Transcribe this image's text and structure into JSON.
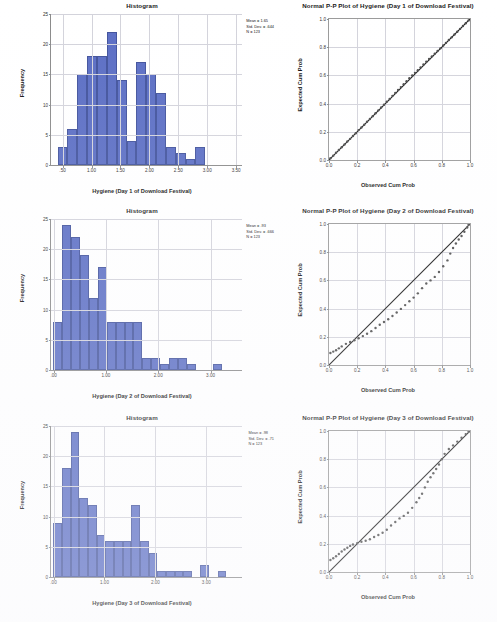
{
  "document": {
    "kind": "spss-output-figure-sheet",
    "background_color": "#ffffff",
    "bar_color": "#5b6ec4",
    "bar_edge_color": "#41529c",
    "grid_color": "#d3d3db",
    "point_color": "#4a4a4a",
    "reference_line_color": "#111111"
  },
  "chart_data": [
    {
      "type": "bar",
      "id": "histogram-day1",
      "title": "Histogram",
      "xlabel": "Hygiene (Day 1 of Download Festival)",
      "ylabel": "Frequency",
      "ylim": [
        0,
        25
      ],
      "yticks": [
        0,
        5,
        10,
        15,
        20,
        25
      ],
      "xlim": [
        0.3,
        3.6
      ],
      "xticks": [
        0.5,
        1.0,
        1.5,
        2.0,
        2.5,
        3.0,
        3.5
      ],
      "xticklabels": [
        ".50",
        "1.00",
        "1.50",
        "2.00",
        "2.50",
        "3.00",
        "3.50"
      ],
      "grid": true,
      "bin_width": 0.17,
      "categories": [
        "0.50",
        "0.67",
        "0.84",
        "1.01",
        "1.18",
        "1.35",
        "1.52",
        "1.69",
        "1.86",
        "2.03",
        "2.20",
        "2.37",
        "2.54",
        "2.71",
        "2.88",
        "3.05",
        "3.22"
      ],
      "values": [
        3,
        6,
        15,
        18,
        18,
        22,
        14,
        4,
        17,
        15,
        12,
        3,
        2,
        1,
        3
      ],
      "annotation": {
        "mean_label": "Mean = 1.65",
        "std_label": "Std. Dev. = .644",
        "n_label": "N = 123",
        "mean": 1.65,
        "std_dev": 0.644,
        "n": 123
      }
    },
    {
      "type": "scatter",
      "id": "pp-plot-day1",
      "title": "Normal P-P Plot of Hygiene (Day 1 of Download Festival)",
      "xlabel": "Observed Cum Prob",
      "ylabel": "Expected Cum Prob",
      "xlim": [
        0,
        1
      ],
      "ylim": [
        0,
        1
      ],
      "xticks": [
        0.0,
        0.2,
        0.4,
        0.6,
        0.8,
        1.0
      ],
      "yticks": [
        0.0,
        0.2,
        0.4,
        0.6,
        0.8,
        1.0
      ],
      "xticklabels": [
        "0.0",
        "0.2",
        "0.4",
        "0.6",
        "0.8",
        "1.0"
      ],
      "yticklabels": [
        "0.0",
        "0.2",
        "0.4",
        "0.6",
        "0.8",
        "1.0"
      ],
      "grid": true,
      "reference_line": [
        [
          0,
          0
        ],
        [
          1,
          1
        ]
      ],
      "points_x": [
        0.01,
        0.03,
        0.05,
        0.07,
        0.09,
        0.11,
        0.13,
        0.15,
        0.17,
        0.19,
        0.21,
        0.23,
        0.25,
        0.27,
        0.29,
        0.31,
        0.33,
        0.35,
        0.37,
        0.39,
        0.41,
        0.43,
        0.45,
        0.47,
        0.49,
        0.51,
        0.53,
        0.55,
        0.57,
        0.59,
        0.61,
        0.63,
        0.65,
        0.67,
        0.69,
        0.71,
        0.73,
        0.75,
        0.77,
        0.79,
        0.81,
        0.83,
        0.85,
        0.87,
        0.89,
        0.91,
        0.93,
        0.95,
        0.97,
        0.99
      ],
      "points_y": [
        0.012,
        0.031,
        0.052,
        0.071,
        0.09,
        0.11,
        0.131,
        0.15,
        0.17,
        0.19,
        0.212,
        0.231,
        0.25,
        0.271,
        0.291,
        0.311,
        0.332,
        0.352,
        0.372,
        0.392,
        0.414,
        0.433,
        0.455,
        0.476,
        0.497,
        0.517,
        0.538,
        0.559,
        0.58,
        0.599,
        0.618,
        0.637,
        0.657,
        0.677,
        0.697,
        0.716,
        0.735,
        0.754,
        0.773,
        0.792,
        0.812,
        0.831,
        0.851,
        0.87,
        0.89,
        0.91,
        0.93,
        0.95,
        0.97,
        0.99
      ]
    },
    {
      "type": "bar",
      "id": "histogram-day2",
      "title": "Histogram",
      "xlabel": "Hygiene (Day 2 of Download Festival)",
      "ylabel": "Frequency",
      "ylim": [
        0,
        25
      ],
      "yticks": [
        0,
        5,
        10,
        15,
        20,
        25
      ],
      "xlim": [
        -0.05,
        3.6
      ],
      "xticks": [
        0.0,
        1.0,
        2.0,
        3.0
      ],
      "xticklabels": [
        ".00",
        "1.00",
        "2.00",
        "3.00"
      ],
      "grid": true,
      "bin_width": 0.17,
      "categories": [
        "0.08",
        "0.25",
        "0.42",
        "0.59",
        "0.76",
        "0.93",
        "1.10",
        "1.27",
        "1.44",
        "1.61",
        "1.78",
        "1.95",
        "2.12",
        "2.29",
        "2.46",
        "2.63",
        "2.80",
        "2.97",
        "3.14",
        "3.31",
        "3.48"
      ],
      "values": [
        8,
        24,
        22,
        19,
        12,
        17,
        8,
        8,
        8,
        8,
        2,
        2,
        1,
        2,
        2,
        1,
        0,
        0,
        1
      ],
      "annotation": {
        "mean_label": "Mean = .93",
        "std_label": "Std. Dev. = .666",
        "n_label": "N = 123",
        "mean": 0.93,
        "std_dev": 0.666,
        "n": 123
      }
    },
    {
      "type": "scatter",
      "id": "pp-plot-day2",
      "title": "Normal P-P Plot of Hygiene (Day 2 of Download Festival)",
      "xlabel": "Observed Cum Prob",
      "ylabel": "Expected Cum Prob",
      "xlim": [
        0,
        1
      ],
      "ylim": [
        0,
        1
      ],
      "xticks": [
        0.0,
        0.2,
        0.4,
        0.6,
        0.8,
        1.0
      ],
      "yticks": [
        0.0,
        0.2,
        0.4,
        0.6,
        0.8,
        1.0
      ],
      "xticklabels": [
        "0.0",
        "0.2",
        "0.4",
        "0.6",
        "0.8",
        "1.0"
      ],
      "yticklabels": [
        "0.0",
        "0.2",
        "0.4",
        "0.6",
        "0.8",
        "1.0"
      ],
      "grid": true,
      "reference_line": [
        [
          0,
          0
        ],
        [
          1,
          1
        ]
      ],
      "points_x": [
        0.01,
        0.03,
        0.05,
        0.07,
        0.09,
        0.12,
        0.15,
        0.18,
        0.21,
        0.24,
        0.27,
        0.3,
        0.33,
        0.36,
        0.39,
        0.42,
        0.45,
        0.48,
        0.51,
        0.54,
        0.57,
        0.6,
        0.63,
        0.66,
        0.69,
        0.72,
        0.75,
        0.78,
        0.81,
        0.84,
        0.86,
        0.88,
        0.9,
        0.92,
        0.94,
        0.96,
        0.98,
        0.99
      ],
      "points_y": [
        0.085,
        0.095,
        0.105,
        0.118,
        0.132,
        0.15,
        0.163,
        0.175,
        0.19,
        0.205,
        0.222,
        0.24,
        0.262,
        0.285,
        0.305,
        0.325,
        0.348,
        0.372,
        0.398,
        0.425,
        0.452,
        0.478,
        0.508,
        0.545,
        0.578,
        0.6,
        0.625,
        0.66,
        0.7,
        0.742,
        0.79,
        0.83,
        0.862,
        0.89,
        0.915,
        0.945,
        0.975,
        0.995
      ]
    },
    {
      "type": "bar",
      "id": "histogram-day3",
      "title": "Histogram",
      "xlabel": "Hygiene (Day 3 of Download Festival)",
      "ylabel": "Frequency",
      "ylim": [
        0,
        25
      ],
      "yticks": [
        0,
        5,
        10,
        15,
        20,
        25
      ],
      "xlim": [
        -0.05,
        3.7
      ],
      "xticks": [
        0.0,
        1.0,
        2.0,
        3.0
      ],
      "xticklabels": [
        ".00",
        "1.00",
        "2.00",
        "3.00"
      ],
      "grid": true,
      "bin_width": 0.17,
      "categories": [
        "0.08",
        "0.25",
        "0.42",
        "0.59",
        "0.76",
        "0.93",
        "1.10",
        "1.27",
        "1.44",
        "1.61",
        "1.78",
        "1.95",
        "2.12",
        "2.29",
        "2.46",
        "2.63",
        "2.80",
        "2.97",
        "3.14",
        "3.31",
        "3.48"
      ],
      "values": [
        9,
        18,
        24,
        13,
        12,
        7,
        6,
        6,
        6,
        12,
        6,
        4,
        1,
        1,
        1,
        1,
        0,
        2,
        0,
        1
      ],
      "annotation": {
        "mean_label": "Mean = .98",
        "std_label": "Std. Dev. = .71",
        "n_label": "N = 123",
        "mean": 0.98,
        "std_dev": 0.71,
        "n": 123
      }
    },
    {
      "type": "scatter",
      "id": "pp-plot-day3",
      "title": "Normal P-P Plot of Hygiene (Day 3 of Download Festival)",
      "xlabel": "Observed Cum Prob",
      "ylabel": "Expected Cum Prob",
      "xlim": [
        0,
        1
      ],
      "ylim": [
        0,
        1
      ],
      "xticks": [
        0.0,
        0.2,
        0.4,
        0.6,
        0.8,
        1.0
      ],
      "yticks": [
        0.0,
        0.2,
        0.4,
        0.6,
        0.8,
        1.0
      ],
      "xticklabels": [
        "0.0",
        "0.2",
        "0.4",
        "0.6",
        "0.8",
        "1.0"
      ],
      "yticklabels": [
        "0.0",
        "0.2",
        "0.4",
        "0.6",
        "0.8",
        "1.0"
      ],
      "grid": true,
      "reference_line": [
        [
          0,
          0
        ],
        [
          1,
          1
        ]
      ],
      "points_x": [
        0.01,
        0.03,
        0.05,
        0.07,
        0.09,
        0.11,
        0.13,
        0.15,
        0.17,
        0.2,
        0.23,
        0.26,
        0.29,
        0.32,
        0.35,
        0.38,
        0.41,
        0.44,
        0.47,
        0.5,
        0.53,
        0.56,
        0.59,
        0.62,
        0.64,
        0.66,
        0.68,
        0.7,
        0.72,
        0.74,
        0.76,
        0.78,
        0.8,
        0.82,
        0.85,
        0.88,
        0.91,
        0.94,
        0.97,
        0.99
      ],
      "points_y": [
        0.085,
        0.098,
        0.112,
        0.128,
        0.145,
        0.16,
        0.172,
        0.185,
        0.195,
        0.205,
        0.215,
        0.222,
        0.232,
        0.248,
        0.262,
        0.278,
        0.3,
        0.33,
        0.355,
        0.38,
        0.398,
        0.42,
        0.455,
        0.495,
        0.525,
        0.555,
        0.6,
        0.64,
        0.672,
        0.7,
        0.73,
        0.762,
        0.8,
        0.838,
        0.872,
        0.898,
        0.925,
        0.952,
        0.978,
        0.995
      ]
    }
  ]
}
